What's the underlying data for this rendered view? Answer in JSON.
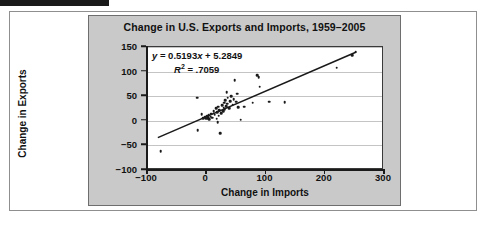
{
  "figure": {
    "black_bar_label": "",
    "frame_color": "#8f8f8f",
    "panel_color": "#c9c9c9",
    "plot_bg": "#ffffff",
    "ink_color": "#1a1a1a"
  },
  "annotation": {
    "equation_y": "y",
    "equation_eq": " = 0.5193",
    "equation_x": "x",
    "equation_tail": " + 5.2849",
    "r2_symbol": "R",
    "r2_sup": "2",
    "r2_value": " = .7059"
  },
  "chart_data": {
    "type": "scatter",
    "title": "Change in U.S. Exports and Imports, 1959–2005",
    "xlabel": "Change in Imports",
    "ylabel": "Change in Exports",
    "xlim": [
      -100,
      300
    ],
    "ylim": [
      -100,
      150
    ],
    "xticks": [
      -100,
      0,
      100,
      200,
      300
    ],
    "xtick_labels": [
      "−100",
      "0",
      "100",
      "200",
      "300"
    ],
    "yticks": [
      -100,
      -50,
      0,
      50,
      100,
      150
    ],
    "ytick_labels": [
      "−100",
      "−50",
      "0",
      "50",
      "100",
      "150"
    ],
    "grid": "horizontal",
    "legend": "none",
    "fit": {
      "type": "linear",
      "slope": 0.5193,
      "intercept": 5.2849,
      "r_squared": 0.7059,
      "label": "y = 0.5193x + 5.2849",
      "r2_label": "R² = .7059",
      "x_start": -80,
      "x_end": 255
    },
    "points": [
      [
        -75,
        -64
      ],
      [
        -14,
        45
      ],
      [
        -13,
        -21
      ],
      [
        -6,
        11
      ],
      [
        -3,
        3
      ],
      [
        0,
        5
      ],
      [
        2,
        2
      ],
      [
        3,
        7
      ],
      [
        5,
        3
      ],
      [
        6,
        9
      ],
      [
        7,
        1
      ],
      [
        9,
        6
      ],
      [
        10,
        12
      ],
      [
        12,
        4
      ],
      [
        14,
        18
      ],
      [
        16,
        10
      ],
      [
        18,
        23
      ],
      [
        19,
        2
      ],
      [
        20,
        15
      ],
      [
        21,
        -5
      ],
      [
        22,
        27
      ],
      [
        23,
        8
      ],
      [
        24,
        20
      ],
      [
        25,
        -27
      ],
      [
        27,
        14
      ],
      [
        29,
        30
      ],
      [
        30,
        17
      ],
      [
        31,
        25
      ],
      [
        32,
        35
      ],
      [
        33,
        22
      ],
      [
        34,
        40
      ],
      [
        35,
        28
      ],
      [
        36,
        56
      ],
      [
        37,
        33
      ],
      [
        38,
        45
      ],
      [
        40,
        24
      ],
      [
        42,
        38
      ],
      [
        44,
        48
      ],
      [
        46,
        31
      ],
      [
        48,
        42
      ],
      [
        50,
        81
      ],
      [
        52,
        37
      ],
      [
        54,
        53
      ],
      [
        56,
        26
      ],
      [
        60,
        0
      ],
      [
        66,
        27
      ],
      [
        80,
        35
      ],
      [
        88,
        91
      ],
      [
        90,
        86
      ],
      [
        92,
        67
      ],
      [
        108,
        37
      ],
      [
        134,
        36
      ],
      [
        222,
        106
      ],
      [
        248,
        131
      ],
      [
        254,
        138
      ]
    ]
  },
  "axes": {
    "ylabel": "Change in Exports",
    "xlabel": "Change in Imports"
  }
}
